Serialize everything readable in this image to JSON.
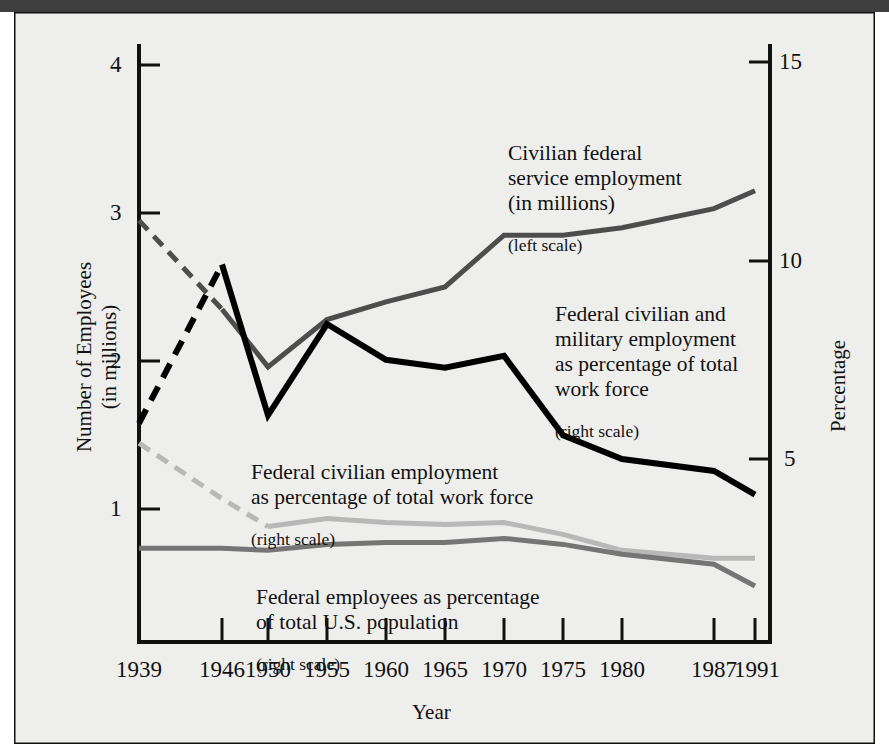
{
  "figure": {
    "background_color": "#eeeeec",
    "border_color": "#000000",
    "top_bar_color": "#3f3f3f"
  },
  "axes": {
    "left": {
      "title": "Number of Employees\n(in millions)",
      "ticks": [
        "4",
        "3",
        "2",
        "1"
      ],
      "tick_values": [
        4,
        3,
        2,
        1
      ],
      "range": [
        0,
        4.45
      ]
    },
    "right": {
      "title": "Percentage",
      "ticks": [
        "15",
        "10",
        "5"
      ],
      "tick_values": [
        15,
        10,
        5
      ],
      "range": [
        0,
        16.5
      ]
    },
    "x": {
      "title": "Year",
      "ticks": [
        "1939",
        "1946",
        "1950",
        "1955",
        "1960",
        "1965",
        "1970",
        "1975",
        "1980",
        "1987",
        "1991"
      ]
    }
  },
  "annotations": [
    {
      "name": "civilian-federal-service-employment",
      "main": "Civilian federal\nservice employment\n(in millions)",
      "sub": "(left scale)",
      "x": 508,
      "y": 122
    },
    {
      "name": "federal-civilian-and-military-employment",
      "main": "Federal civilian and\nmilitary employment\nas percentage of total\nwork force",
      "sub": "(right scale)",
      "x": 555,
      "y": 283
    },
    {
      "name": "federal-civilian-employment",
      "main": "Federal civilian employment\nas percentage of total work force",
      "sub": "(right scale)",
      "x": 251,
      "y": 441
    },
    {
      "name": "federal-employees-percent-population",
      "main": "Federal employees as percentage\nof total U.S. population",
      "sub": "(right scale)",
      "x": 256,
      "y": 566
    }
  ],
  "chart_data": {
    "type": "line",
    "xlabel": "Year",
    "ylabel": "Number of Employees (in millions)",
    "y2label": "Percentage",
    "x": [
      1939,
      1946,
      1950,
      1955,
      1960,
      1965,
      1970,
      1975,
      1980,
      1987,
      1991
    ],
    "ylim": [
      0,
      4.45
    ],
    "y2lim": [
      0,
      16.5
    ],
    "grid": false,
    "legend": "inline-annotations",
    "series": [
      {
        "name": "Civilian federal service employment (in millions)",
        "scale": "left",
        "color": "#4d4d4d",
        "width": 5,
        "dashed_segment": [
          1939,
          1946
        ],
        "x": [
          1939,
          1946,
          1950,
          1955,
          1960,
          1965,
          1970,
          1975,
          1980,
          1987,
          1991
        ],
        "values": [
          2.95,
          2.35,
          1.96,
          2.28,
          2.4,
          2.5,
          2.85,
          2.85,
          2.9,
          3.03,
          3.15
        ]
      },
      {
        "name": "Federal civilian and military employment as percentage of total work force",
        "scale": "right",
        "color": "#000000",
        "width": 6,
        "dashed_segment": [
          1939,
          1946
        ],
        "x": [
          1939,
          1946,
          1950,
          1955,
          1960,
          1965,
          1970,
          1975,
          1980,
          1987,
          1991
        ],
        "values": [
          5.9,
          9.9,
          6.1,
          8.4,
          7.5,
          7.3,
          7.6,
          5.6,
          5.0,
          4.7,
          4.1
        ]
      },
      {
        "name": "Federal civilian employment as percentage of total work force",
        "scale": "right",
        "color": "#b8b8b8",
        "width": 5,
        "dashed_segment": [
          1939,
          1950
        ],
        "x": [
          1939,
          1946,
          1950,
          1955,
          1960,
          1965,
          1970,
          1975,
          1980,
          1987,
          1991
        ],
        "values": [
          5.4,
          4.0,
          3.3,
          3.5,
          3.4,
          3.35,
          3.4,
          3.1,
          2.7,
          2.5,
          2.5
        ]
      },
      {
        "name": "Federal employees as percentage of total U.S. population",
        "scale": "right",
        "color": "#757575",
        "width": 5,
        "dashed_segment": null,
        "x": [
          1939,
          1946,
          1950,
          1955,
          1960,
          1965,
          1970,
          1975,
          1980,
          1987,
          1991
        ],
        "values": [
          2.75,
          2.75,
          2.7,
          2.85,
          2.9,
          2.9,
          3.0,
          2.85,
          2.6,
          2.35,
          1.8
        ]
      }
    ]
  }
}
